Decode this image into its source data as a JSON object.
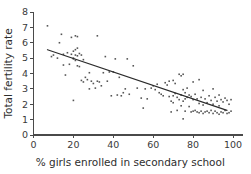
{
  "chart_data": {
    "type": "scatter",
    "title": "",
    "xlabel": "% girls enrolled in secondary school",
    "ylabel": "Total fertility rate",
    "xlim": [
      0,
      105
    ],
    "ylim": [
      0,
      8
    ],
    "xticks": [
      0,
      20,
      40,
      60,
      80,
      100
    ],
    "xticklabels": [
      "0",
      "20",
      "40",
      "60",
      "80",
      "100"
    ],
    "yticks": [
      0,
      1,
      2,
      3,
      4,
      5,
      6,
      7,
      8
    ],
    "yticklabels": [
      "0",
      "1",
      "2",
      "3",
      "4",
      "5",
      "6",
      "7",
      "8"
    ],
    "grid": false,
    "legend": null,
    "marker_color": "#555555",
    "marker_size": 1.6,
    "trend_line": {
      "label": "linear fit",
      "color": "#2b2b2b",
      "x_start": 7,
      "y_start": 5.55,
      "x_end": 97,
      "y_end": 1.6
    },
    "points": [
      [
        7,
        7.1
      ],
      [
        9,
        5.1
      ],
      [
        10,
        5.2
      ],
      [
        12,
        5.0
      ],
      [
        13,
        6.0
      ],
      [
        14,
        6.55
      ],
      [
        15,
        5.25
      ],
      [
        15,
        4.55
      ],
      [
        16,
        3.9
      ],
      [
        17,
        5.35
      ],
      [
        18,
        4.6
      ],
      [
        19,
        5.25
      ],
      [
        19,
        6.35
      ],
      [
        20,
        5.45
      ],
      [
        20,
        5.0
      ],
      [
        20,
        4.95
      ],
      [
        20,
        2.25
      ],
      [
        21,
        5.55
      ],
      [
        21,
        5.2
      ],
      [
        21,
        4.85
      ],
      [
        21,
        6.45
      ],
      [
        22,
        6.4
      ],
      [
        22,
        5.65
      ],
      [
        22,
        5.15
      ],
      [
        22,
        4.5
      ],
      [
        23,
        5.3
      ],
      [
        23,
        4.45
      ],
      [
        24,
        5.2
      ],
      [
        24,
        3.55
      ],
      [
        25,
        4.9
      ],
      [
        25,
        3.45
      ],
      [
        26,
        3.75
      ],
      [
        27,
        3.6
      ],
      [
        28,
        4.05
      ],
      [
        28,
        3.0
      ],
      [
        29,
        3.5
      ],
      [
        30,
        3.35
      ],
      [
        31,
        3.05
      ],
      [
        32,
        6.45
      ],
      [
        32,
        3.5
      ],
      [
        33,
        3.45
      ],
      [
        34,
        3.2
      ],
      [
        35,
        4.05
      ],
      [
        36,
        5.1
      ],
      [
        37,
        3.5
      ],
      [
        38,
        4.1
      ],
      [
        39,
        2.55
      ],
      [
        40,
        4.1
      ],
      [
        41,
        4.95
      ],
      [
        42,
        2.6
      ],
      [
        43,
        3.75
      ],
      [
        44,
        2.55
      ],
      [
        45,
        2.75
      ],
      [
        46,
        3.0
      ],
      [
        47,
        4.95
      ],
      [
        48,
        2.65
      ],
      [
        50,
        4.5
      ],
      [
        52,
        3.05
      ],
      [
        54,
        2.4
      ],
      [
        55,
        1.75
      ],
      [
        56,
        3.0
      ],
      [
        57,
        2.35
      ],
      [
        59,
        3.05
      ],
      [
        60,
        3.2
      ],
      [
        61,
        2.95
      ],
      [
        62,
        3.3
      ],
      [
        63,
        2.75
      ],
      [
        64,
        2.65
      ],
      [
        65,
        2.55
      ],
      [
        66,
        3.4
      ],
      [
        67,
        3.25
      ],
      [
        68,
        3.5
      ],
      [
        68,
        2.5
      ],
      [
        69,
        2.2
      ],
      [
        69,
        1.5
      ],
      [
        70,
        3.55
      ],
      [
        70,
        2.55
      ],
      [
        70,
        2.1
      ],
      [
        71,
        3.35
      ],
      [
        71,
        2.7
      ],
      [
        72,
        2.45
      ],
      [
        72,
        1.6
      ],
      [
        73,
        3.95
      ],
      [
        73,
        2.3
      ],
      [
        74,
        3.85
      ],
      [
        74,
        2.6
      ],
      [
        74,
        1.9
      ],
      [
        75,
        3.95
      ],
      [
        75,
        2.95
      ],
      [
        75,
        2.2
      ],
      [
        75,
        1.05
      ],
      [
        76,
        2.75
      ],
      [
        76,
        2.35
      ],
      [
        76,
        1.55
      ],
      [
        77,
        3.05
      ],
      [
        77,
        2.45
      ],
      [
        78,
        2.6
      ],
      [
        78,
        1.85
      ],
      [
        79,
        2.5
      ],
      [
        79,
        1.5
      ],
      [
        80,
        3.45
      ],
      [
        80,
        2.3
      ],
      [
        80,
        1.55
      ],
      [
        81,
        2.65
      ],
      [
        81,
        1.6
      ],
      [
        82,
        2.35
      ],
      [
        82,
        1.5
      ],
      [
        83,
        3.6
      ],
      [
        83,
        2.05
      ],
      [
        83,
        1.45
      ],
      [
        84,
        2.45
      ],
      [
        84,
        1.55
      ],
      [
        85,
        2.9
      ],
      [
        85,
        1.95
      ],
      [
        85,
        1.4
      ],
      [
        86,
        2.35
      ],
      [
        86,
        1.5
      ],
      [
        87,
        2.1
      ],
      [
        87,
        1.55
      ],
      [
        88,
        2.55
      ],
      [
        88,
        1.45
      ],
      [
        89,
        2.25
      ],
      [
        89,
        1.6
      ],
      [
        90,
        3.0
      ],
      [
        90,
        2.0
      ],
      [
        90,
        1.4
      ],
      [
        91,
        2.45
      ],
      [
        91,
        1.55
      ],
      [
        92,
        2.2
      ],
      [
        92,
        1.45
      ],
      [
        93,
        2.6
      ],
      [
        93,
        1.9
      ],
      [
        93,
        1.35
      ],
      [
        94,
        2.3
      ],
      [
        94,
        1.5
      ],
      [
        95,
        2.15
      ],
      [
        95,
        1.45
      ],
      [
        96,
        2.4
      ],
      [
        96,
        1.6
      ],
      [
        97,
        2.25
      ],
      [
        97,
        1.4
      ],
      [
        98,
        2.0
      ],
      [
        98,
        1.45
      ],
      [
        99,
        2.3
      ],
      [
        99,
        1.55
      ]
    ]
  }
}
